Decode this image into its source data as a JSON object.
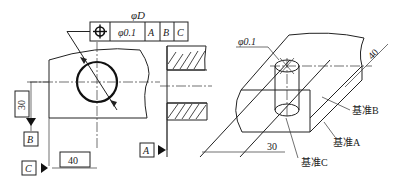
{
  "left_view": {
    "feature_control_frame": {
      "size_label": "φD",
      "symbol": "position-icon",
      "tolerance": "φ0.1",
      "datums": [
        "A",
        "B",
        "C"
      ]
    },
    "dimensions": {
      "vertical": "30",
      "horizontal": "40"
    },
    "datum_labels": {
      "b": "B",
      "c": "C",
      "a": "A"
    }
  },
  "right_view": {
    "tolerance_zone": "φ0.1",
    "dimensions": {
      "diag": "40",
      "horizontal": "30"
    },
    "datum_notes": {
      "b": "基准B",
      "a": "基准A",
      "c": "基准C"
    }
  }
}
